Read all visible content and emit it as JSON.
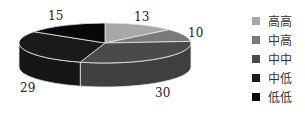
{
  "chart_data": {
    "type": "pie",
    "style": "3d",
    "title": "",
    "categories": [
      "高高",
      "中高",
      "中中",
      "中低",
      "低低"
    ],
    "values": [
      13,
      10,
      30,
      29,
      15
    ],
    "colors": [
      "#a8a8a8",
      "#7a7a7a",
      "#4a4a4a",
      "#1a1a1a",
      "#080808"
    ],
    "data_labels": [
      "13",
      "10",
      "30",
      "29",
      "15"
    ],
    "legend_position": "right"
  },
  "legend": {
    "items": [
      {
        "label": "高高",
        "color": "#a8a8a8"
      },
      {
        "label": "中高",
        "color": "#7a7a7a"
      },
      {
        "label": "中中",
        "color": "#4a4a4a"
      },
      {
        "label": "中低",
        "color": "#1a1a1a"
      },
      {
        "label": "低低",
        "color": "#080808"
      }
    ]
  }
}
